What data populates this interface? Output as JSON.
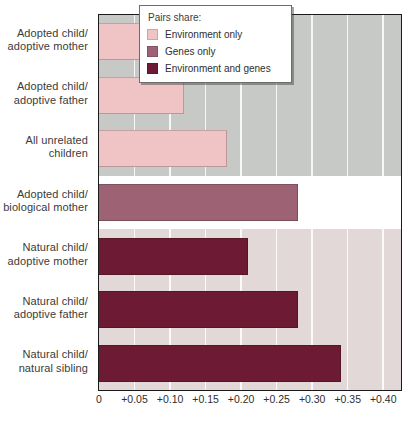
{
  "chart_data": {
    "type": "bar",
    "orientation": "horizontal",
    "title": "",
    "subtitle": "",
    "xlabel": "",
    "ylabel": "",
    "xlim": [
      0,
      0.425
    ],
    "grid": true,
    "legend_position": "top-right",
    "categories": [
      "Adopted child/\nadoptive mother",
      "Adopted child/\nadoptive father",
      "All unrelated\nchildren",
      "Adopted child/\nbiological mother",
      "Natural child/\nadoptive mother",
      "Natural child/\nadoptive father",
      "Natural child/\nnatural sibling"
    ],
    "values": [
      0.15,
      0.12,
      0.18,
      0.28,
      0.21,
      0.28,
      0.34
    ],
    "point_series": [
      "environment_only",
      "environment_only",
      "environment_only",
      "genes_only",
      "environment_and_genes",
      "environment_and_genes",
      "environment_and_genes"
    ],
    "series": [
      {
        "name": "Environment only",
        "key": "environment_only",
        "color": "#f0c4c5",
        "values": [
          0.15,
          0.12,
          0.18,
          null,
          null,
          null,
          null
        ]
      },
      {
        "name": "Genes only",
        "key": "genes_only",
        "color": "#9d6374",
        "values": [
          null,
          null,
          null,
          0.28,
          null,
          null,
          null
        ]
      },
      {
        "name": "Environment and genes",
        "key": "environment_and_genes",
        "color": "#6d1b35",
        "values": [
          null,
          null,
          null,
          null,
          0.21,
          0.28,
          0.34
        ]
      }
    ],
    "xticks": [
      {
        "value": 0,
        "label": "0"
      },
      {
        "value": 0.05,
        "label": "+0.05"
      },
      {
        "value": 0.1,
        "label": "+0.10"
      },
      {
        "value": 0.15,
        "label": "+0.15"
      },
      {
        "value": 0.2,
        "label": "+0.20"
      },
      {
        "value": 0.25,
        "label": "+0.25"
      },
      {
        "value": 0.3,
        "label": "+0.30"
      },
      {
        "value": 0.35,
        "label": "+0.35"
      },
      {
        "value": 0.4,
        "label": "+0.40"
      }
    ],
    "bands": [
      {
        "rows": [
          0,
          1,
          2
        ],
        "color": "#c6c9c6",
        "name": "gray-band"
      },
      {
        "rows": [
          3
        ],
        "color": "#ffffff",
        "name": "white-band"
      },
      {
        "rows": [
          4,
          5,
          6
        ],
        "color": "#e2d8d8",
        "name": "pink-band"
      }
    ]
  },
  "ylabels": [
    {
      "line1": "Adopted child/",
      "line2": "adoptive mother"
    },
    {
      "line1": "Adopted child/",
      "line2": "adoptive father"
    },
    {
      "line1": "All unrelated",
      "line2": "children"
    },
    {
      "line1": "Adopted child/",
      "line2": "biological mother"
    },
    {
      "line1": "Natural child/",
      "line2": "adoptive mother"
    },
    {
      "line1": "Natural child/",
      "line2": "adoptive father"
    },
    {
      "line1": "Natural child/",
      "line2": "natural sibling"
    }
  ],
  "legend": {
    "title": "Pairs share:",
    "items": [
      {
        "label": "Environment only",
        "color": "#f0c4c5"
      },
      {
        "label": "Genes only",
        "color": "#9d6374"
      },
      {
        "label": "Environment and genes",
        "color": "#6d1b35"
      }
    ]
  },
  "colors": {
    "environment_only": "#f0c4c5",
    "genes_only": "#9d6374",
    "environment_and_genes": "#6d1b35",
    "band_gray": "#c6c9c6",
    "band_white": "#ffffff",
    "band_pink": "#e2d8d8",
    "axis": "#1b1b1b",
    "gridline": "#ffffff"
  }
}
